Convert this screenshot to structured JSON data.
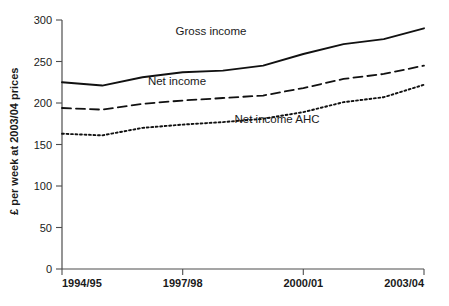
{
  "chart_data": {
    "type": "line",
    "title": "",
    "subtitle": "",
    "xlabel": "",
    "ylabel": "£ per week at 2003/04 prices",
    "x": [
      "1994/95",
      "1995/96",
      "1996/97",
      "1997/98",
      "1998/99",
      "1999/00",
      "2000/01",
      "2001/02",
      "2002/03",
      "2003/04"
    ],
    "categories": [
      "1994/95",
      "1995/96",
      "1996/97",
      "1997/98",
      "1998/99",
      "1999/00",
      "2000/01",
      "2001/02",
      "2002/03",
      "2003/04"
    ],
    "xtick_labels": [
      "1994/95",
      "1997/98",
      "2000/01",
      "2003/04"
    ],
    "xtick_indices": [
      0,
      3,
      6,
      9
    ],
    "ytick_labels": [
      "0",
      "50",
      "100",
      "150",
      "200",
      "250",
      "300"
    ],
    "yticks": [
      0,
      50,
      100,
      150,
      200,
      250,
      300
    ],
    "ylim": [
      0,
      300
    ],
    "grid": false,
    "legend_position": "inline-annotations",
    "series": [
      {
        "name": "Gross income",
        "style": "solid",
        "color": "#111111",
        "values": [
          225,
          221,
          231,
          237,
          239,
          245,
          259,
          271,
          277,
          290
        ]
      },
      {
        "name": "Net income",
        "style": "dashed",
        "color": "#111111",
        "values": [
          194,
          192,
          199,
          203,
          206,
          209,
          218,
          229,
          235,
          245
        ]
      },
      {
        "name": "Net income AHC",
        "style": "dotted",
        "color": "#111111",
        "values": [
          163,
          161,
          170,
          174,
          177,
          181,
          189,
          201,
          207,
          222
        ]
      }
    ],
    "annotations": [
      {
        "text": "Gross income",
        "x_px": 211,
        "y_px": 35
      },
      {
        "text": "Net income",
        "x_px": 177,
        "y_px": 85
      },
      {
        "text": "Net income AHC",
        "x_px": 277,
        "y_px": 123
      }
    ]
  },
  "axes": {
    "y_axis_title": "£ per week at 2003/04 prices",
    "y_tick_0": "0",
    "y_tick_50": "50",
    "y_tick_100": "100",
    "y_tick_150": "150",
    "y_tick_200": "200",
    "y_tick_250": "250",
    "y_tick_300": "300",
    "x_tick_1": "1994/95",
    "x_tick_2": "1997/98",
    "x_tick_3": "2000/01",
    "x_tick_4": "2003/04"
  },
  "colors": {
    "line": "#111111",
    "axis": "#4d4d4d",
    "background": "#ffffff",
    "text": "#1a1a1a"
  }
}
